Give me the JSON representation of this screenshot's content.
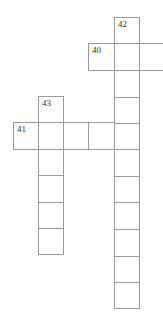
{
  "puzzle": {
    "entries": [
      {
        "number": "42",
        "direction": "down",
        "length": 11
      },
      {
        "number": "40",
        "direction": "across",
        "length": 3
      },
      {
        "number": "43",
        "direction": "down",
        "length": 6
      },
      {
        "number": "41",
        "direction": "across",
        "length": 5
      }
    ],
    "labels": {
      "n40": "40",
      "n41": "41",
      "n42": "42",
      "n43": "43"
    },
    "colors": {
      "grid_line": "#9a9a9a",
      "number_text": "#333333",
      "cell_fill": "#ffffff"
    }
  }
}
